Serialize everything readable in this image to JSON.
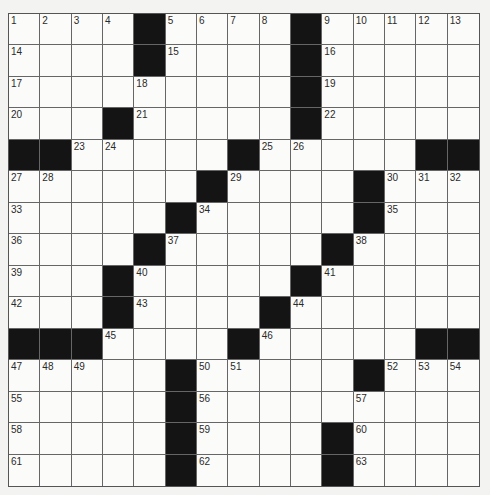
{
  "puzzle": {
    "rows": 15,
    "cols": 15,
    "colors": {
      "block": "#141414",
      "cell": "#fbfbf9",
      "line": "#666666",
      "background": "#f3f3f1"
    },
    "layout": [
      "....#....#.....",
      "....#....#.....",
      ".........#.....",
      "...#.....#.....",
      "##.....#.....##",
      "......#....#...",
      ".....#.....#...",
      "....#.....#....",
      "...#.....#.....",
      "...#....#......",
      "###....#.....##",
      ".....#.....#...",
      ".....#.........",
      ".....#....#....",
      ".....#....#...."
    ],
    "numbers": [
      [
        1,
        2,
        3,
        4,
        0,
        5,
        6,
        7,
        8,
        0,
        9,
        10,
        11,
        12,
        13
      ],
      [
        14,
        0,
        0,
        0,
        0,
        15,
        0,
        0,
        0,
        0,
        16,
        0,
        0,
        0,
        0
      ],
      [
        17,
        0,
        0,
        0,
        18,
        0,
        0,
        0,
        0,
        0,
        19,
        0,
        0,
        0,
        0
      ],
      [
        20,
        0,
        0,
        0,
        21,
        0,
        0,
        0,
        0,
        0,
        22,
        0,
        0,
        0,
        0
      ],
      [
        0,
        0,
        23,
        24,
        0,
        0,
        0,
        0,
        25,
        26,
        0,
        0,
        0,
        0,
        0
      ],
      [
        27,
        28,
        0,
        0,
        0,
        0,
        0,
        29,
        0,
        0,
        0,
        0,
        30,
        31,
        32
      ],
      [
        33,
        0,
        0,
        0,
        0,
        0,
        34,
        0,
        0,
        0,
        0,
        0,
        35,
        0,
        0
      ],
      [
        36,
        0,
        0,
        0,
        0,
        37,
        0,
        0,
        0,
        0,
        0,
        38,
        0,
        0,
        0
      ],
      [
        39,
        0,
        0,
        0,
        40,
        0,
        0,
        0,
        0,
        0,
        41,
        0,
        0,
        0,
        0
      ],
      [
        42,
        0,
        0,
        0,
        43,
        0,
        0,
        0,
        0,
        44,
        0,
        0,
        0,
        0,
        0
      ],
      [
        0,
        0,
        0,
        45,
        0,
        0,
        0,
        0,
        46,
        0,
        0,
        0,
        0,
        0,
        0
      ],
      [
        47,
        48,
        49,
        0,
        0,
        0,
        50,
        51,
        0,
        0,
        0,
        0,
        52,
        53,
        54
      ],
      [
        55,
        0,
        0,
        0,
        0,
        0,
        56,
        0,
        0,
        0,
        0,
        57,
        0,
        0,
        0
      ],
      [
        58,
        0,
        0,
        0,
        0,
        0,
        59,
        0,
        0,
        0,
        0,
        60,
        0,
        0,
        0
      ],
      [
        61,
        0,
        0,
        0,
        0,
        0,
        62,
        0,
        0,
        0,
        0,
        63,
        0,
        0,
        0
      ]
    ]
  }
}
